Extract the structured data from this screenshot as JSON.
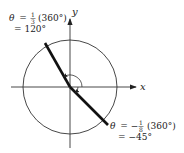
{
  "diagram": {
    "axes": {
      "x_label": "x",
      "y_label": "y"
    },
    "angles": [
      {
        "id": "positive",
        "line1_theta": "θ",
        "line1_eq": "=",
        "line1_frac_num": "1",
        "line1_frac_den": "3",
        "line1_paren": "(360°)",
        "line2": "= 120°",
        "degrees": 120
      },
      {
        "id": "negative",
        "line1_theta": "θ",
        "line1_eq": "= −",
        "line1_frac_num": "1",
        "line1_frac_den": "8",
        "line1_paren": "(360°)",
        "line2": "= −45°",
        "degrees": -45
      }
    ],
    "colors": {
      "stroke": "#222222",
      "background": "#ffffff"
    }
  }
}
